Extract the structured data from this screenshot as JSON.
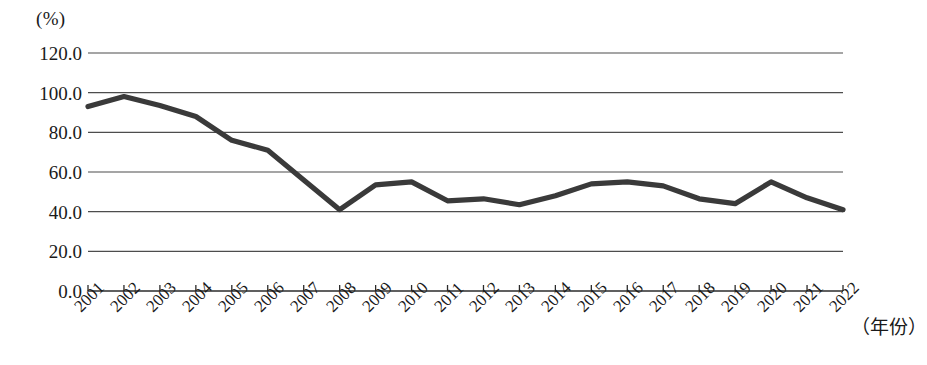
{
  "chart_data": {
    "type": "line",
    "title": "",
    "xlabel": "（年份）",
    "ylabel": "(%)",
    "ylim": [
      0,
      120
    ],
    "xlim": [
      "2001",
      "2022"
    ],
    "grid": true,
    "legend": "none",
    "y_ticks": [
      "120.0",
      "100.0",
      "80.0",
      "60.0",
      "40.0",
      "20.0",
      "0.0"
    ],
    "y_tick_values": [
      120,
      100,
      80,
      60,
      40,
      20,
      0
    ],
    "categories": [
      "2001",
      "2002",
      "2003",
      "2004",
      "2005",
      "2006",
      "2007",
      "2008",
      "2009",
      "2010",
      "2011",
      "2012",
      "2013",
      "2014",
      "2015",
      "2016",
      "2017",
      "2018",
      "2019",
      "2020",
      "2021",
      "2022"
    ],
    "series": [
      {
        "name": "",
        "color": "#3a3a3a",
        "values": [
          93.0,
          98.0,
          93.5,
          88.0,
          76.0,
          71.0,
          56.0,
          41.0,
          53.5,
          55.0,
          45.5,
          46.5,
          43.5,
          48.0,
          54.0,
          55.0,
          53.0,
          46.5,
          44.0,
          55.0,
          47.0,
          41.0
        ]
      }
    ]
  },
  "axis": {
    "unit_label": "(%)",
    "x_title": "（年份）"
  },
  "style": {
    "line_color": "#3a3a3a",
    "grid_color": "#4d4d4d",
    "axis_color": "#2b2b2b",
    "background": "#ffffff"
  }
}
